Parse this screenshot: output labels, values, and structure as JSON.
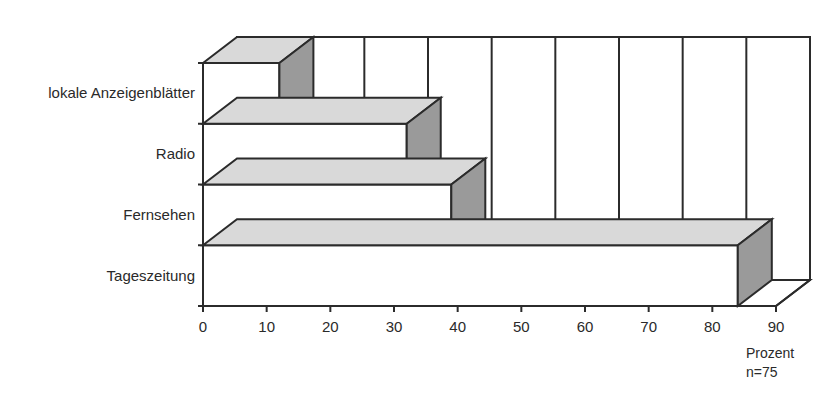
{
  "chart_data": {
    "type": "bar",
    "orientation": "horizontal",
    "style": "3d",
    "title": "",
    "categories": [
      "lokale Anzeigenblätter",
      "Radio",
      "Fernsehen",
      "Tageszeitung"
    ],
    "values": [
      12,
      32,
      39,
      84
    ],
    "xlabel": "Prozent",
    "note": "n=75",
    "ylabel": "",
    "xlim": [
      0,
      90
    ],
    "xticks": [
      "0",
      "10",
      "20",
      "30",
      "40",
      "50",
      "60",
      "70",
      "80",
      "90"
    ],
    "grid": true,
    "legend": null
  },
  "colors": {
    "front": "#ffffff",
    "top": "#d9d9d9",
    "side": "#9a9a9a",
    "line": "#2b2b2b",
    "text": "#2a2a2a"
  }
}
